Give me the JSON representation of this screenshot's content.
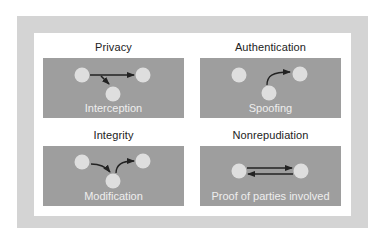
{
  "diagram": {
    "colors": {
      "outer_frame": "#d4d4d4",
      "card": "#ffffff",
      "panel": "#9e9e9e",
      "node": "#dedede",
      "arrow": "#222222",
      "title_text": "#222222",
      "caption_text": "#eeeeee"
    },
    "quadrants": [
      {
        "title": "Privacy",
        "caption": "Interception",
        "nodes": 3,
        "arrows": [
          "left-node to right-node",
          "third party intercepts (arrow down to bottom node)"
        ]
      },
      {
        "title": "Authentication",
        "caption": "Spoofing",
        "nodes": 3,
        "arrows": [
          "bottom node curves up to right node"
        ]
      },
      {
        "title": "Integrity",
        "caption": "Modification",
        "nodes": 3,
        "arrows": [
          "left node to bottom node",
          "bottom node to right node"
        ]
      },
      {
        "title": "Nonrepudiation",
        "caption": "Proof of parties involved",
        "nodes": 2,
        "arrows": [
          "left node to right node",
          "right node to left node"
        ]
      }
    ]
  }
}
